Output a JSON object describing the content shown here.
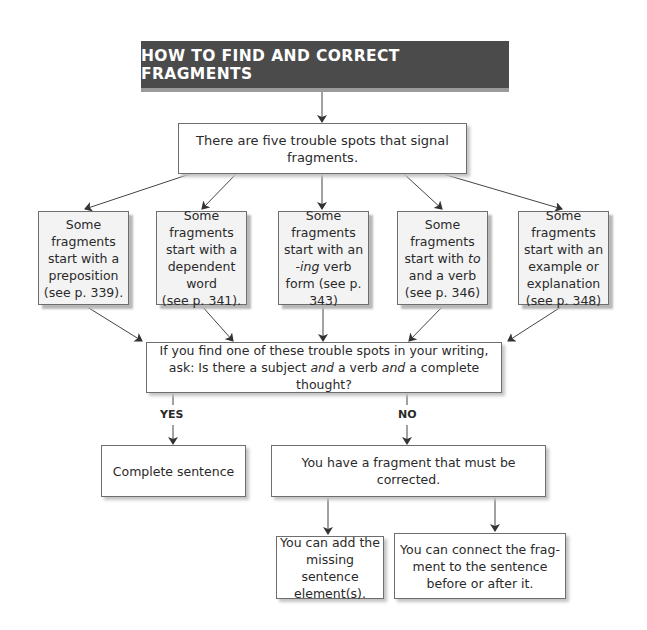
{
  "title": "HOW TO FIND AND CORRECT FRAGMENTS",
  "intro": "There are five trouble spots that signal fragments.",
  "trouble_spots": [
    {
      "lines": [
        "Some fragments",
        "start with a",
        "preposition",
        "(see p. 339)."
      ]
    },
    {
      "lines": [
        "Some fragments",
        "start with a",
        "dependent word",
        "(see p. 341)."
      ]
    },
    {
      "pre": "Some fragments start with an ",
      "italic": "-ing",
      "post": " verb form (see p. 343)"
    },
    {
      "pre": "Some fragments start with ",
      "italic": "to",
      "post": " and a verb (see p. 346)"
    },
    {
      "lines": [
        "Some fragments",
        "start with an",
        "example or",
        "explanation",
        "(see p. 348)"
      ]
    }
  ],
  "question": {
    "line1": "If you find one of these trouble spots in your writing,",
    "line2_a": "ask: Is there a subject ",
    "line2_and1": "and",
    "line2_b": " a verb ",
    "line2_and2": "and",
    "line2_c": " a complete thought?"
  },
  "branches": {
    "yes_label": "YES",
    "no_label": "NO",
    "yes_result": "Complete sentence",
    "no_result": "You have a fragment that must be corrected."
  },
  "corrections": [
    "You can add the missing sentence element(s).",
    "You can connect the frag-ment to the sentence before or after it."
  ],
  "colors": {
    "banner_bg": "#4b4b4b",
    "banner_text": "#ffffff",
    "box_border": "#6e6e6e",
    "shaded_box_bg": "#f3f3f3",
    "arrow": "#333333"
  }
}
